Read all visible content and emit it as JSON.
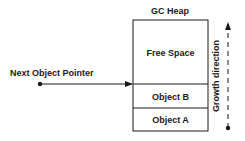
{
  "diagram": {
    "heap_title": "GC Heap",
    "regions": [
      {
        "id": "free-space",
        "label": "Free Space"
      },
      {
        "id": "object-b",
        "label": "Object B"
      },
      {
        "id": "object-a",
        "label": "Object A"
      }
    ],
    "pointer_label": "Next Object Pointer",
    "growth_label": "Growth direction",
    "colors": {
      "stroke": "#1a1a1a",
      "text": "#1a1a1a",
      "background": "#ffffff"
    }
  }
}
